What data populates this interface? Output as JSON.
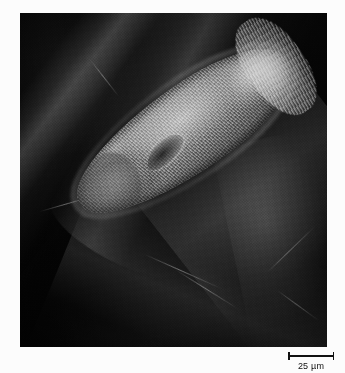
{
  "page": {
    "background_color": "#fcfcfc"
  },
  "figure": {
    "panel": {
      "name": "sem-micrograph",
      "background_color": "#020202",
      "subject": "ciliate-protozoan"
    },
    "scalebar": {
      "label": "25 µm",
      "value": 25,
      "unit": "µm",
      "bar_color": "#111111",
      "position": "bottom-right"
    }
  },
  "image_content": {
    "modality": "scanning-electron-micrograph",
    "subject_label": "ciliate-protozoan",
    "subject_features": [
      "ciliated-body-surface",
      "oral-groove",
      "anterior-ciliary-tuft",
      "tapered-posterior-end"
    ],
    "background_features": [
      "dark-substrate",
      "crossing-fibres",
      "stray-filaments"
    ]
  }
}
